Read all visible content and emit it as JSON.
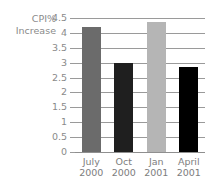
{
  "chart_data": {
    "type": "bar",
    "title": "",
    "xlabel": "",
    "ylabel": "CPI% Increase",
    "ylabel_lines": [
      "CPI%",
      "Increase"
    ],
    "categories": [
      "July 2000",
      "Oct 2000",
      "Jan 2001",
      "April 2001"
    ],
    "category_lines": [
      [
        "July",
        "2000"
      ],
      [
        "Oct",
        "2000"
      ],
      [
        "Jan",
        "2001"
      ],
      [
        "April",
        "2001"
      ]
    ],
    "values": [
      4.2,
      3.0,
      4.35,
      2.87
    ],
    "bar_colors": [
      "#6b6b6b",
      "#1f1f1f",
      "#b5b5b5",
      "#000000"
    ],
    "ylim": [
      0,
      4.5
    ],
    "ytick_labels": [
      "4.5",
      "4",
      "3.5",
      "3",
      "2.5",
      "2",
      "1.5",
      "1",
      "0.5",
      "0"
    ],
    "ytick_values": [
      4.5,
      4,
      3.5,
      3,
      2.5,
      2,
      1.5,
      1,
      0.5,
      0
    ],
    "grid": true,
    "legend": false,
    "legend_position": "none",
    "axis_color": "#9a9a9a",
    "tick_label_color": "#8a8a8a",
    "background": "#ffffff"
  }
}
